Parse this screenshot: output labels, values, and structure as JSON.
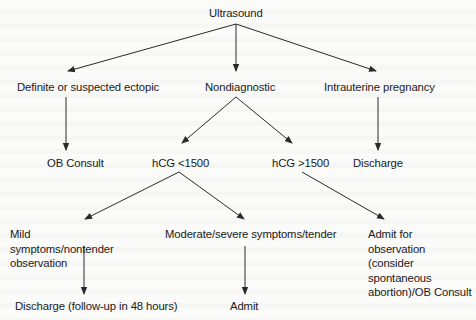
{
  "diagram": {
    "type": "flowchart",
    "nodes": {
      "ultrasound": "Ultrasound",
      "ectopic": "Definite or suspected ectopic",
      "nondiagnostic": "Nondiagnostic",
      "intrauterine": "Intrauterine pregnancy",
      "ob_consult": "OB Consult",
      "hcg_low": "hCG <1500",
      "hcg_high": "hCG >1500",
      "discharge": "Discharge",
      "mild": "Mild symptoms/nontender observation",
      "moderate": "Moderate/severe symptoms/tender",
      "admit_observation": "Admit for observation (consider spontaneous abortion)/OB Consult",
      "discharge_followup": "Discharge (follow-up in 48 hours)",
      "admit": "Admit"
    },
    "edges": [
      {
        "from": "ultrasound",
        "to": "ectopic"
      },
      {
        "from": "ultrasound",
        "to": "nondiagnostic"
      },
      {
        "from": "ultrasound",
        "to": "intrauterine"
      },
      {
        "from": "ectopic",
        "to": "ob_consult"
      },
      {
        "from": "nondiagnostic",
        "to": "hcg_low"
      },
      {
        "from": "nondiagnostic",
        "to": "hcg_high"
      },
      {
        "from": "intrauterine",
        "to": "discharge"
      },
      {
        "from": "hcg_low",
        "to": "mild"
      },
      {
        "from": "hcg_low",
        "to": "moderate"
      },
      {
        "from": "hcg_high",
        "to": "admit_observation"
      },
      {
        "from": "mild",
        "to": "discharge_followup"
      },
      {
        "from": "moderate",
        "to": "admit"
      }
    ],
    "colors": {
      "line": "#2a2a2a",
      "text": "#1a1a1a",
      "background": "#fbfbfa"
    }
  }
}
